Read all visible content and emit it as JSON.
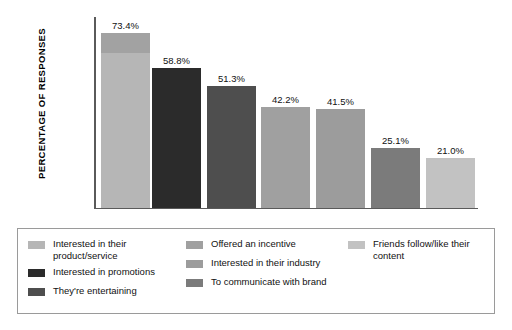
{
  "chart_data": {
    "type": "bar",
    "title": "",
    "subtitle": "",
    "xlabel": "",
    "ylabel": "PERCENTAGE OF RESPONSES",
    "ylim": [
      0,
      80
    ],
    "grid": false,
    "legend_position": "bottom",
    "categories": [
      "Interested in their product/service",
      "Interested in promotions",
      "They're entertaining",
      "Offered an incentive",
      "Interested in their industry",
      "To communicate with brand",
      "Friends follow/like their content"
    ],
    "values": [
      73.4,
      58.8,
      51.3,
      42.2,
      41.5,
      25.1,
      21.0
    ],
    "value_labels": [
      "73.4%",
      "58.8%",
      "51.3%",
      "42.2%",
      "41.5%",
      "25.1%",
      "21.0%"
    ],
    "colors": [
      "#b6b6b6",
      "#2b2b2b",
      "#4e4e4e",
      "#a0a0a0",
      "#9c9c9c",
      "#7b7b7b",
      "#c2c2c2"
    ],
    "axis_color": "#5a5a5a"
  },
  "legend": {
    "columns": [
      {
        "items": [
          {
            "label": "Interested in their product/service",
            "color": "#b6b6b6"
          },
          {
            "label": "Interested in promotions",
            "color": "#2b2b2b"
          },
          {
            "label": "They're entertaining",
            "color": "#4e4e4e"
          }
        ]
      },
      {
        "items": [
          {
            "label": "Offered an incentive",
            "color": "#a0a0a0"
          },
          {
            "label": "Interested in their industry",
            "color": "#9c9c9c"
          },
          {
            "label": "To communicate with brand",
            "color": "#7b7b7b"
          }
        ]
      },
      {
        "items": [
          {
            "label": "Friends follow/like their content",
            "color": "#c2c2c2"
          }
        ]
      }
    ],
    "border_color": "#9a9a9a"
  }
}
